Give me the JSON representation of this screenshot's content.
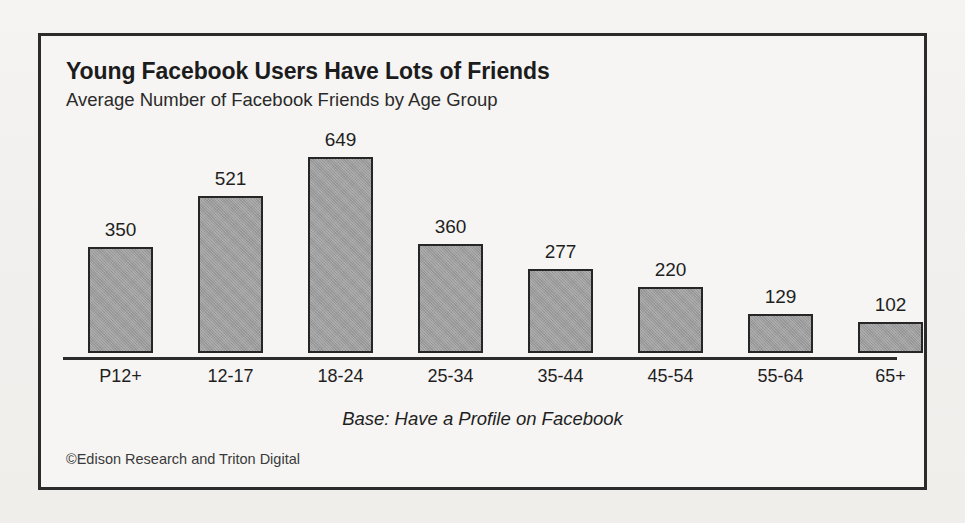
{
  "chart_data": {
    "type": "bar",
    "title": "Young Facebook Users Have Lots of Friends",
    "subtitle": "Average Number of Facebook Friends by Age Group",
    "categories": [
      "P12+",
      "12-17",
      "18-24",
      "25-34",
      "35-44",
      "45-54",
      "55-64",
      "65+"
    ],
    "values": [
      350,
      521,
      649,
      360,
      277,
      220,
      129,
      102
    ],
    "xlabel": "",
    "ylabel": "",
    "ylim": [
      0,
      649
    ],
    "grid": false,
    "legend": false,
    "axis_visible": "x-only",
    "data_labels": true,
    "base_note": "Base: Have a Profile on Facebook",
    "source": "©Edison Research and Triton Digital",
    "bar_color": "#9c9c9c",
    "bar_border_color": "#262626",
    "text_color": "#1f1f1f",
    "background_color": "#f6f5f3",
    "frame_color": "#2b2b2b"
  }
}
